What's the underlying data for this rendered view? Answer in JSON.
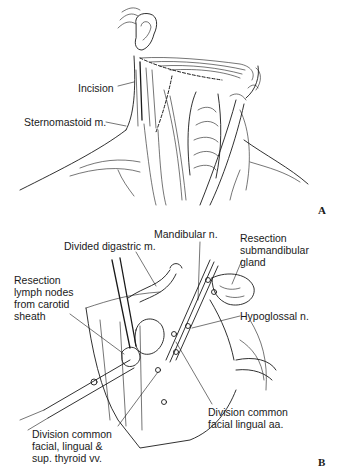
{
  "figure_a": {
    "panel_label": "A",
    "labels": {
      "incision": "Incision",
      "sternomastoid": "Sternomastoid m."
    }
  },
  "figure_b": {
    "panel_label": "B",
    "labels": {
      "mandibular_n": "Mandibular n.",
      "divided_digastric": "Divided digastric m.",
      "resection_submandibular": [
        "Resection",
        "submandibular",
        "gland"
      ],
      "resection_lymph": [
        "Resection",
        "lymph nodes",
        "from carotid",
        "sheath"
      ],
      "hypoglossal": "Hypoglossal n.",
      "division_common_facial_aa": [
        "Division common",
        "facial lingual aa."
      ],
      "division_common_facial_vv": [
        "Division common",
        "facial, lingual &",
        "sup. thyroid vv."
      ]
    }
  }
}
